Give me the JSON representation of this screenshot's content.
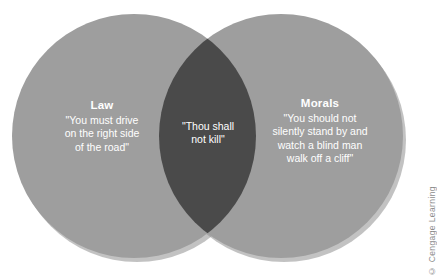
{
  "figure": {
    "type": "venn-diagram",
    "background_color": "#ffffff",
    "circle_fill": "#9e9e9e",
    "overlap_fill": "#4a4a4a",
    "circle_shadow": "#8a8a8a",
    "text_color": "#ffffff"
  },
  "left_set": {
    "title": "Law",
    "body": "\"You must drive\non the right side\nof the road\""
  },
  "right_set": {
    "title": "Morals",
    "body": "\"You should not\nsilently stand by and\nwatch a blind man\nwalk off a cliff\""
  },
  "intersection": {
    "body": "\"Thou shall\nnot kill\""
  },
  "attribution": {
    "text": "© Cengage Learning"
  }
}
